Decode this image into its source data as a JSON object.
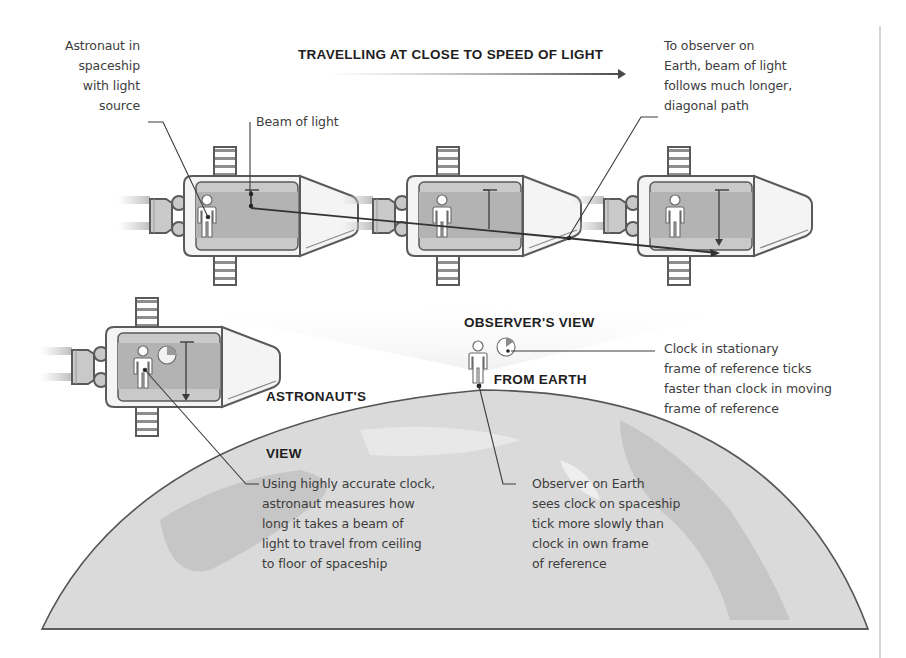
{
  "title": "TRAVELLING AT CLOSE TO SPEED OF LIGHT",
  "headings": {
    "observers_view": [
      "OBSERVER'S VIEW",
      "FROM EARTH"
    ],
    "astronauts_view": [
      "ASTRONAUT'S",
      "VIEW"
    ]
  },
  "annotations": {
    "astronaut_in_spaceship": "Astronaut in\nspaceship\nwith light\nsource",
    "beam_of_light": "Beam of light",
    "observer_on_earth_path": "To observer on\nEarth, beam of light\nfollows much longer,\ndiagonal path",
    "clock_stationary": "Clock in stationary\nframe of reference ticks\nfaster than clock in moving\nframe of reference",
    "astronaut_measures": "Using highly accurate clock,\nastronaut measures how\nlong it takes a beam of\nlight to travel from ceiling\nto floor of spaceship",
    "observer_sees_clock": "Observer on Earth\nsees clock on spaceship\ntick more slowly than\nclock in own frame\nof reference"
  },
  "colors": {
    "outline": "#5a5a5a",
    "hull": "#f4f4f4",
    "cabin": "#b9b9b9",
    "cabin_band": "#cfcfcf",
    "earth": "#d9d9d9",
    "earth_land": "#c4c4c4",
    "beam": "#3c3c3c",
    "text": "#3d3d3d"
  },
  "icons": [
    "spaceship-icon",
    "astronaut-icon",
    "clock-icon",
    "observer-icon",
    "earth-icon",
    "arrow-right-icon"
  ]
}
